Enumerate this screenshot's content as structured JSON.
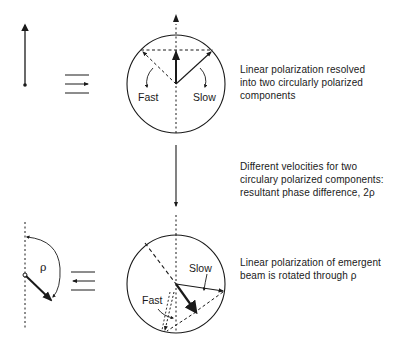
{
  "diagram": {
    "colors": {
      "ink": "#1a1a1a",
      "background": "#ffffff"
    },
    "labels": {
      "fast_top": "Fast",
      "slow_top": "Slow",
      "fast_bottom": "Fast",
      "slow_bottom": "Slow",
      "rho_symbol": "ρ"
    },
    "captions": [
      {
        "lines": [
          "Linear polarization resolved",
          "into two circularly polarized",
          "components"
        ]
      },
      {
        "lines": [
          "Different velocities for two",
          "circulary polarized components:",
          "resultant phase difference, 2ρ"
        ]
      },
      {
        "lines": [
          "Linear polarization of emergent",
          "beam is rotated through ρ"
        ]
      }
    ],
    "symbols": {
      "top_equivalence": "equivalence-with-right-arrow",
      "bottom_equivalence": "equivalence-with-left-arrow"
    }
  }
}
